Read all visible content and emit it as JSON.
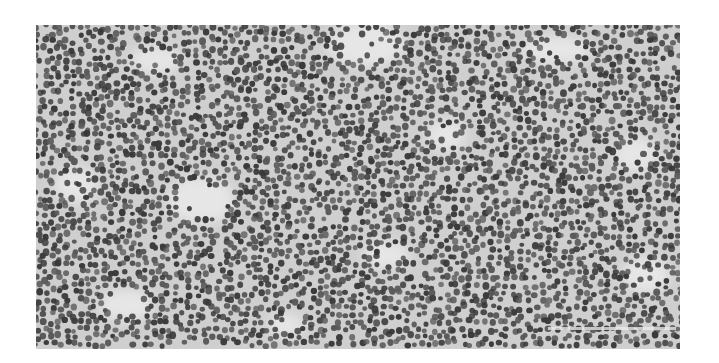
{
  "image": {
    "description": "Grayscale histology micrograph of densely packed lymphocytes with scattered lighter stromal areas",
    "colors": {
      "page_background": "#ffffff",
      "tissue_background": "#cfcfcf",
      "nucleus_dark": "#3a3a3a",
      "nucleus_mid": "#5a5a5a",
      "stroma_light": "#e6e6e6"
    },
    "frame": {
      "left": 36,
      "top": 25,
      "width": 644,
      "height": 324
    },
    "light_patches": [
      {
        "cx": 330,
        "cy": 20,
        "rx": 40,
        "ry": 22
      },
      {
        "cx": 120,
        "cy": 35,
        "rx": 26,
        "ry": 14
      },
      {
        "cx": 520,
        "cy": 25,
        "rx": 36,
        "ry": 14
      },
      {
        "cx": 165,
        "cy": 175,
        "rx": 34,
        "ry": 24
      },
      {
        "cx": 40,
        "cy": 160,
        "rx": 22,
        "ry": 18
      },
      {
        "cx": 410,
        "cy": 110,
        "rx": 20,
        "ry": 16
      },
      {
        "cx": 600,
        "cy": 130,
        "rx": 22,
        "ry": 18
      },
      {
        "cx": 90,
        "cy": 280,
        "rx": 28,
        "ry": 16
      },
      {
        "cx": 350,
        "cy": 230,
        "rx": 24,
        "ry": 14
      },
      {
        "cx": 610,
        "cy": 250,
        "rx": 24,
        "ry": 18
      },
      {
        "cx": 250,
        "cy": 300,
        "rx": 18,
        "ry": 12
      }
    ],
    "scale_bar": {
      "left": 512,
      "top": 302,
      "width": 128,
      "height": 3
    }
  }
}
